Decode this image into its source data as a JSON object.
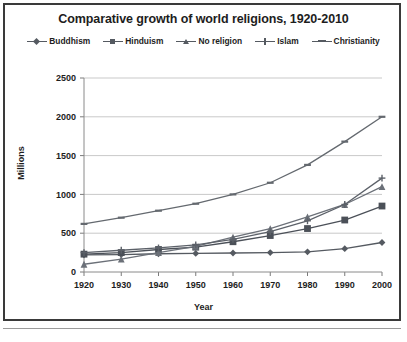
{
  "figure": {
    "title": "Comparative growth of world religions, 1920-2010",
    "axis_x_label": "Year",
    "axis_y_label": "Millions"
  },
  "legend": {
    "position": "top",
    "items": [
      {
        "label": "Buddhism",
        "marker": "diamond",
        "color": "#555a61"
      },
      {
        "label": "Hinduism",
        "marker": "square",
        "color": "#4b5058"
      },
      {
        "label": "No religion",
        "marker": "triangle",
        "color": "#6b7078"
      },
      {
        "label": "Islam",
        "marker": "cross",
        "color": "#5c6169"
      },
      {
        "label": "Christianity",
        "marker": "bar",
        "color": "#64696f"
      }
    ]
  },
  "chart_data": {
    "type": "line",
    "title": "Comparative growth of world religions, 1920-2010",
    "xlabel": "Year",
    "ylabel": "Millions",
    "x": [
      1920,
      1930,
      1940,
      1950,
      1960,
      1970,
      1980,
      1990,
      2000
    ],
    "xtick_labels": [
      "1920",
      "1930",
      "1940",
      "1950",
      "1960",
      "1970",
      "1980",
      "1990",
      "2000"
    ],
    "ytick_labels": [
      "0",
      "500",
      "1000",
      "1500",
      "2000",
      "2500"
    ],
    "yticks": [
      0,
      500,
      1000,
      1500,
      2000,
      2500
    ],
    "xlim": [
      1920,
      2000
    ],
    "ylim": [
      0,
      2500
    ],
    "grid": true,
    "grid_axis": "y",
    "series": [
      {
        "name": "Buddhism",
        "marker": "diamond",
        "color": "#555a61",
        "values": [
          220,
          225,
          235,
          240,
          245,
          250,
          260,
          300,
          380
        ]
      },
      {
        "name": "Hinduism",
        "marker": "square",
        "color": "#4b5058",
        "values": [
          230,
          250,
          290,
          320,
          390,
          470,
          560,
          670,
          850
        ]
      },
      {
        "name": "No religion",
        "marker": "triangle",
        "color": "#6b7078",
        "values": [
          100,
          165,
          250,
          330,
          450,
          560,
          710,
          870,
          1100
        ]
      },
      {
        "name": "Islam",
        "marker": "cross",
        "color": "#5c6169",
        "values": [
          250,
          280,
          310,
          350,
          420,
          520,
          660,
          870,
          1210
        ]
      },
      {
        "name": "Christianity",
        "marker": "bar",
        "color": "#64696f",
        "values": [
          620,
          700,
          790,
          880,
          1000,
          1150,
          1380,
          1680,
          2000
        ]
      }
    ]
  }
}
